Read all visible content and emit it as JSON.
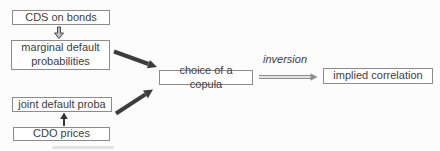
{
  "colors": {
    "page-bg": "#fcfcfc",
    "box-bg": "#ffffff",
    "box-border": "#8c8c8c",
    "text": "#3d3d3d",
    "thick-arrow": "#3c3c3c",
    "thin-arrow": "#8f8f8f",
    "block-arrow-fill": "#bdbdbd",
    "block-arrow-stroke": "#4a4a4a",
    "up-arrow": "#333333"
  },
  "diagram": {
    "nodes": {
      "cds_on_bonds": "CDS on bonds",
      "marginal_default_probabilities": "marginal default probabilities",
      "joint_default_proba": "joint default proba",
      "cdo_prices": "CDO prices",
      "choice_of_a_copula": "choice of a copula",
      "implied_correlation": "implied correlation"
    },
    "edge_labels": {
      "inversion": "inversion"
    }
  }
}
